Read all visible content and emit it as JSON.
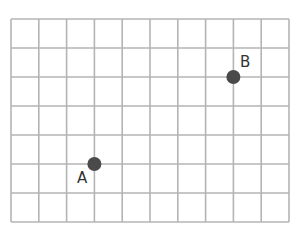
{
  "grid": {
    "columns": 10,
    "rows": 7,
    "left": 11,
    "top": 19,
    "right": 289,
    "bottom": 222,
    "line_color": "#b4b4b4"
  },
  "points": [
    {
      "label": "A",
      "col": 3,
      "row": 5,
      "label_x": 77,
      "label_y": 171
    },
    {
      "label": "B",
      "col": 8,
      "row": 2,
      "label_x": 240,
      "label_y": 55
    }
  ],
  "point_color": "#4a4a4a",
  "point_radius": 7
}
